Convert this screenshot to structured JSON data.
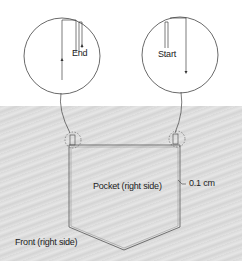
{
  "diagram": {
    "detail_left": {
      "label": "End"
    },
    "detail_right": {
      "label": "Start"
    },
    "pocket_label": "Pocket (right side)",
    "front_label": "Front (right side)",
    "measurement_label": "0.1 cm"
  },
  "colors": {
    "line": "#333333",
    "fabric": "#dcdcdc",
    "background": "#ffffff"
  }
}
